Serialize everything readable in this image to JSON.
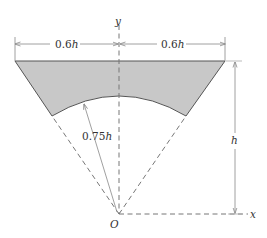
{
  "figure": {
    "type": "geometry-diagram",
    "colors": {
      "fill": "#c8c8c8",
      "outline": "#555555",
      "dashed": "#777777",
      "dimension": "#888888",
      "text": "#333333"
    },
    "labels": {
      "left_width_num": "0.6",
      "left_width_var": "h",
      "right_width_num": "0.6",
      "right_width_var": "h",
      "radius_num": "0.75",
      "radius_var": "h",
      "height_var": "h",
      "y_axis": "y",
      "x_axis": "x",
      "origin": "O"
    },
    "dimensions": {
      "half_top_width": "0.6h",
      "inner_radius": "0.75h",
      "height": "h"
    }
  }
}
